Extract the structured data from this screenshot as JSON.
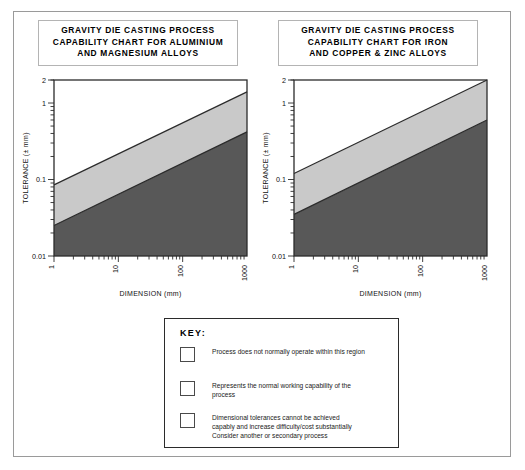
{
  "charts": [
    {
      "id": "aluminium-magnesium",
      "title_lines": [
        "GRAVITY DIE CASTING PROCESS",
        "CAPABILITY CHART FOR ALUMINIUM",
        "AND MAGNESIUM ALLOYS"
      ],
      "xlabel": "DIMENSION (mm)",
      "ylabel": "TOLERANCE (± mm)",
      "x_ticks": [
        "1",
        "10",
        "100",
        "1000"
      ],
      "y_ticks": [
        "0.01",
        "0.1",
        "1",
        "2"
      ]
    },
    {
      "id": "iron-copper-zinc",
      "title_lines": [
        "GRAVITY DIE CASTING PROCESS",
        "CAPABILITY CHART FOR IRON",
        "AND COPPER & ZINC ALLOYS"
      ],
      "xlabel": "DIMENSION (mm)",
      "ylabel": "TOLERANCE (± mm)",
      "x_ticks": [
        "1",
        "10",
        "100",
        "1000"
      ],
      "y_ticks": [
        "0.01",
        "0.1",
        "1",
        "2"
      ]
    }
  ],
  "key": {
    "title": "KEY:",
    "entries": [
      {
        "swatch_color": "#ffffff",
        "lines": [
          "Process does not normally operate within this region"
        ]
      },
      {
        "swatch_color": "#c9c9c9",
        "lines": [
          "Represents the normal working capability of the",
          "process"
        ]
      },
      {
        "swatch_color": "#585858",
        "lines": [
          "Dimensional tolerances cannot be achieved",
          "capably and increase difficulty/cost substantially",
          "Consider another or secondary process"
        ]
      }
    ]
  },
  "colors": {
    "region_white": "#ffffff",
    "region_light": "#c9c9c9",
    "region_dark": "#585858",
    "axis": "#2b2b2b",
    "frame": "#9a9a9a"
  },
  "chart_data": [
    {
      "type": "area",
      "title": "GRAVITY DIE CASTING PROCESS CAPABILITY CHART FOR ALUMINIUM AND MAGNESIUM ALLOYS",
      "xlabel": "DIMENSION (mm)",
      "ylabel": "TOLERANCE (± mm)",
      "xscale": "log",
      "yscale": "log",
      "xlim": [
        1,
        1000
      ],
      "ylim": [
        0.01,
        2
      ],
      "xticks": [
        1,
        10,
        100,
        1000
      ],
      "yticks": [
        0.01,
        0.1,
        1,
        2
      ],
      "grid": false,
      "legend_position": "external-key",
      "series": [
        {
          "name": "upper boundary (white / normal-working divide)",
          "x": [
            1,
            1000
          ],
          "y": [
            0.085,
            1.4
          ]
        },
        {
          "name": "lower boundary (normal-working / difficult divide)",
          "x": [
            1,
            1000
          ],
          "y": [
            0.025,
            0.42
          ]
        }
      ],
      "regions": [
        {
          "name": "Process does not normally operate within this region",
          "color": "#ffffff",
          "above": "upper boundary (white / normal-working divide)"
        },
        {
          "name": "Represents the normal working capability of the process",
          "color": "#c9c9c9",
          "between": [
            "lower boundary (normal-working / difficult divide)",
            "upper boundary (white / normal-working divide)"
          ]
        },
        {
          "name": "Dimensional tolerances cannot be achieved capably and increase difficulty/cost substantially. Consider another or secondary process",
          "color": "#585858",
          "below": "lower boundary (normal-working / difficult divide)"
        }
      ]
    },
    {
      "type": "area",
      "title": "GRAVITY DIE CASTING PROCESS CAPABILITY CHART FOR IRON AND COPPER & ZINC ALLOYS",
      "xlabel": "DIMENSION (mm)",
      "ylabel": "TOLERANCE (± mm)",
      "xscale": "log",
      "yscale": "log",
      "xlim": [
        1,
        1000
      ],
      "ylim": [
        0.01,
        2
      ],
      "xticks": [
        1,
        10,
        100,
        1000
      ],
      "yticks": [
        0.01,
        0.1,
        1,
        2
      ],
      "grid": false,
      "legend_position": "external-key",
      "series": [
        {
          "name": "upper boundary (white / normal-working divide)",
          "x": [
            1,
            1000
          ],
          "y": [
            0.12,
            2.0
          ]
        },
        {
          "name": "lower boundary (normal-working / difficult divide)",
          "x": [
            1,
            1000
          ],
          "y": [
            0.035,
            0.6
          ]
        }
      ],
      "regions": [
        {
          "name": "Process does not normally operate within this region",
          "color": "#ffffff",
          "above": "upper boundary (white / normal-working divide)"
        },
        {
          "name": "Represents the normal working capability of the process",
          "color": "#c9c9c9",
          "between": [
            "lower boundary (normal-working / difficult divide)",
            "upper boundary (white / normal-working divide)"
          ]
        },
        {
          "name": "Dimensional tolerances cannot be achieved capably and increase difficulty/cost substantially. Consider another or secondary process",
          "color": "#585858",
          "below": "lower boundary (normal-working / difficult divide)"
        }
      ]
    }
  ]
}
